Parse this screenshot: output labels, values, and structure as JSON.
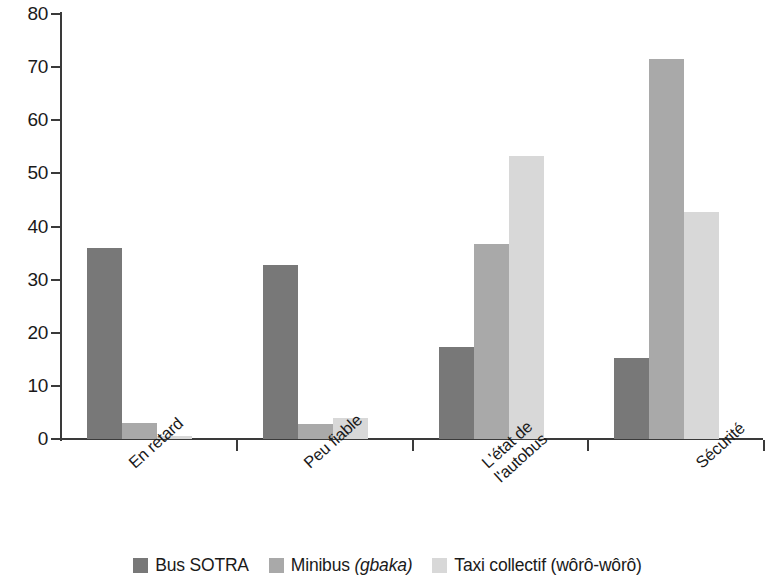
{
  "chart_data": {
    "type": "bar",
    "title": "",
    "subtitle": "",
    "xlabel": "",
    "ylabel": "",
    "ylim": [
      0,
      80
    ],
    "ytick_step": 10,
    "yticks": [
      "80",
      "70",
      "60",
      "50",
      "40",
      "30",
      "20",
      "10",
      "0"
    ],
    "grid": false,
    "legend_position": "bottom",
    "categories": [
      "En retard",
      "Peu fiable",
      "L'état de\nl'autobus",
      "Sécurité"
    ],
    "series": [
      {
        "name": "Bus SOTRA",
        "name_plain": "Bus SOTRA",
        "name_italic_part": "",
        "color": "#787878",
        "values": [
          36,
          32.8,
          17.4,
          15.2
        ]
      },
      {
        "name": "Minibus (gbaka)",
        "name_plain": "Minibus ",
        "name_italic_part": "(gbaka)",
        "color": "#a9a9a9",
        "values": [
          3.1,
          2.9,
          36.8,
          71.6
        ]
      },
      {
        "name": "Taxi collectif (wôrô-wôrô)",
        "name_plain": "Taxi collectif (wôrô-wôrô)",
        "name_italic_part": "",
        "color": "#d8d8d8",
        "values": [
          0.6,
          4.0,
          53.2,
          42.8
        ]
      }
    ]
  },
  "axis": {
    "y_tick_labels": [
      "80",
      "70",
      "60",
      "50",
      "40",
      "30",
      "20",
      "10",
      "0"
    ]
  },
  "legend": {
    "items": [
      {
        "label": "Bus SOTRA",
        "plain": "Bus SOTRA",
        "italic": ""
      },
      {
        "label": "Minibus (gbaka)",
        "plain": "Minibus ",
        "italic": "(gbaka)"
      },
      {
        "label": "Taxi collectif (wôrô-wôrô)",
        "plain": "Taxi collectif (wôrô-wôrô)",
        "italic": ""
      }
    ]
  },
  "colors": {
    "series_1": "#787878",
    "series_2": "#a9a9a9",
    "series_3": "#e2e2e2",
    "axis": "#3a3a3a",
    "text": "#1a1a1a",
    "background": "#ffffff"
  }
}
